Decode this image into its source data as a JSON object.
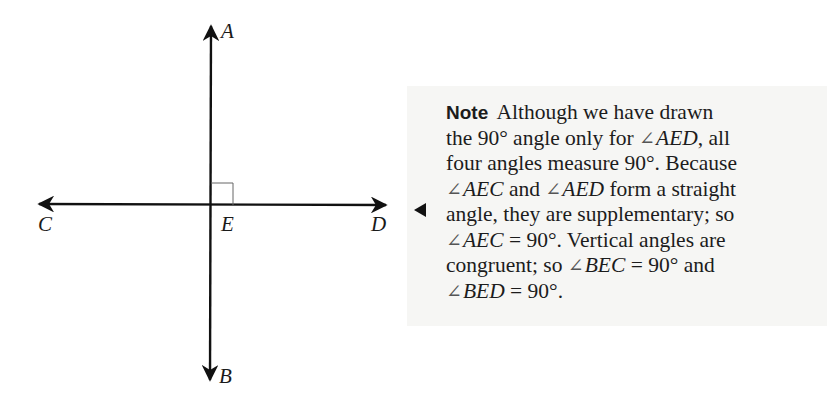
{
  "diagram": {
    "type": "perpendicular-lines",
    "points": {
      "A": {
        "label": "A"
      },
      "B": {
        "label": "B"
      },
      "C": {
        "label": "C"
      },
      "D": {
        "label": "D"
      },
      "E": {
        "label": "E"
      }
    },
    "right_angle_marker": "AED",
    "line_color": "#111111"
  },
  "note": {
    "title": "Note",
    "pointer": "left-triangle",
    "lines": [
      {
        "segments": [
          {
            "text": " Although we have drawn",
            "style": "normal"
          }
        ]
      },
      {
        "segments": [
          {
            "text": "the 90° angle only for ",
            "style": "normal"
          },
          {
            "text": "∠",
            "style": "angle"
          },
          {
            "text": "AED",
            "style": "italic"
          },
          {
            "text": ", all",
            "style": "normal"
          }
        ]
      },
      {
        "segments": [
          {
            "text": "four angles measure 90°. Because",
            "style": "normal"
          }
        ]
      },
      {
        "segments": [
          {
            "text": "∠",
            "style": "angle"
          },
          {
            "text": "AEC",
            "style": "italic"
          },
          {
            "text": " and ",
            "style": "normal"
          },
          {
            "text": "∠",
            "style": "angle"
          },
          {
            "text": "AED",
            "style": "italic"
          },
          {
            "text": " form a straight",
            "style": "normal"
          }
        ]
      },
      {
        "segments": [
          {
            "text": "angle, they are supplementary; so",
            "style": "normal"
          }
        ]
      },
      {
        "segments": [
          {
            "text": "∠",
            "style": "angle"
          },
          {
            "text": "AEC",
            "style": "italic"
          },
          {
            "text": " = 90°. Vertical angles are",
            "style": "normal"
          }
        ]
      },
      {
        "segments": [
          {
            "text": "congruent; so ",
            "style": "normal"
          },
          {
            "text": "∠",
            "style": "angle"
          },
          {
            "text": "BEC",
            "style": "italic"
          },
          {
            "text": " = 90° and",
            "style": "normal"
          }
        ]
      },
      {
        "segments": [
          {
            "text": "∠",
            "style": "angle"
          },
          {
            "text": "BED",
            "style": "italic"
          },
          {
            "text": " = 90°.",
            "style": "normal"
          }
        ]
      }
    ]
  }
}
